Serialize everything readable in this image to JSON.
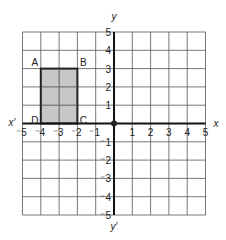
{
  "diagram": {
    "axes": {
      "x_label": "x",
      "x_neg_label": "x′",
      "y_label": "y",
      "y_neg_label": "y′",
      "x_range": [
        -5,
        5
      ],
      "y_range": [
        -5,
        5
      ]
    },
    "x_ticks": [
      {
        "value": -5,
        "label": "-5"
      },
      {
        "value": -4,
        "label": "-4"
      },
      {
        "value": -3,
        "label": "-3"
      },
      {
        "value": -2,
        "label": "-2"
      },
      {
        "value": -1,
        "label": "-1"
      },
      {
        "value": 1,
        "label": "1"
      },
      {
        "value": 2,
        "label": "2"
      },
      {
        "value": 3,
        "label": "3"
      },
      {
        "value": 4,
        "label": "4"
      },
      {
        "value": 5,
        "label": "5"
      }
    ],
    "y_ticks": [
      {
        "value": 5,
        "label": "5"
      },
      {
        "value": 4,
        "label": "4"
      },
      {
        "value": 3,
        "label": "3"
      },
      {
        "value": 2,
        "label": "2"
      },
      {
        "value": 1,
        "label": "1"
      },
      {
        "value": -1,
        "label": "-1"
      },
      {
        "value": -2,
        "label": "-2"
      },
      {
        "value": -3,
        "label": "-3"
      },
      {
        "value": -4,
        "label": "-4"
      },
      {
        "value": -5,
        "label": "-5"
      }
    ],
    "rectangle": {
      "fill": "#bdbdbd",
      "stroke": "#222222",
      "vertices": [
        {
          "name": "A",
          "x": -4,
          "y": 3
        },
        {
          "name": "B",
          "x": -2,
          "y": 3
        },
        {
          "name": "C",
          "x": -2,
          "y": 0
        },
        {
          "name": "D",
          "x": -4,
          "y": 0
        }
      ]
    },
    "origin_marker": "filled-dot"
  }
}
